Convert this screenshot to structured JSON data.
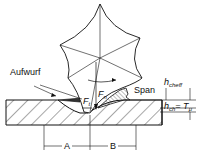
{
  "diagram": {
    "labels": {
      "aufwurf": "Aufwurf",
      "span": "Span",
      "fn_main": "F",
      "fn_sub": "n",
      "ft_main": "F",
      "ft_sub": "t",
      "hcheff_main": "h",
      "hcheff_sub": "cheff",
      "hch_main": "h",
      "hch_sub": "ch",
      "hch_eq": "= T",
      "hch_eq_sub": "μ",
      "a": "A",
      "b": "B"
    }
  }
}
